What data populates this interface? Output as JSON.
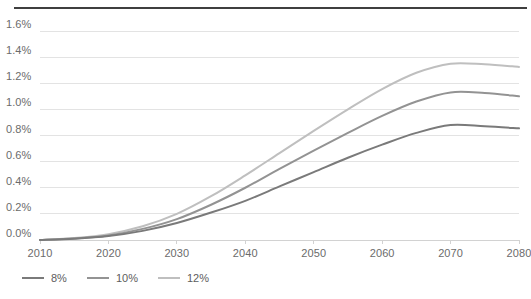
{
  "chart_data": {
    "type": "line",
    "title": "",
    "subtitle": "",
    "xlabel": "",
    "ylabel": "",
    "grid": true,
    "legend_position": "bottom-left",
    "xlim": [
      2010,
      2080
    ],
    "ylim": [
      0.0,
      1.6
    ],
    "x_tick_labels": [
      "2010",
      "2020",
      "2030",
      "2040",
      "2050",
      "2060",
      "2070",
      "2080"
    ],
    "x_ticks": [
      2010,
      2020,
      2030,
      2040,
      2050,
      2060,
      2070,
      2080
    ],
    "y_tick_labels": [
      "0.0%",
      "0.2%",
      "0.4%",
      "0.6%",
      "0.8%",
      "1.0%",
      "1.2%",
      "1.4%",
      "1.6%"
    ],
    "y_ticks": [
      0.0,
      0.2,
      0.4,
      0.6,
      0.8,
      1.0,
      1.2,
      1.4,
      1.6
    ],
    "x": [
      2010,
      2015,
      2020,
      2025,
      2030,
      2035,
      2040,
      2045,
      2050,
      2055,
      2060,
      2065,
      2070,
      2075,
      2080
    ],
    "series": [
      {
        "name": "8%",
        "color": "#7a7a7a",
        "values": [
          0.0,
          0.01,
          0.03,
          0.07,
          0.13,
          0.21,
          0.3,
          0.41,
          0.52,
          0.63,
          0.73,
          0.82,
          0.88,
          0.87,
          0.855
        ]
      },
      {
        "name": "10%",
        "color": "#939393",
        "values": [
          0.0,
          0.012,
          0.035,
          0.085,
          0.16,
          0.27,
          0.4,
          0.545,
          0.685,
          0.82,
          0.95,
          1.06,
          1.13,
          1.125,
          1.1
        ]
      },
      {
        "name": "12%",
        "color": "#bfbfbf",
        "values": [
          0.0,
          0.015,
          0.045,
          0.105,
          0.2,
          0.335,
          0.495,
          0.665,
          0.835,
          1.0,
          1.155,
          1.28,
          1.35,
          1.345,
          1.325
        ]
      }
    ]
  },
  "legend": {
    "items": [
      {
        "label": "8%",
        "color": "#7a7a7a"
      },
      {
        "label": "10%",
        "color": "#939393"
      },
      {
        "label": "12%",
        "color": "#bfbfbf"
      }
    ]
  },
  "style": {
    "rule_color": "#3f3f3f",
    "gridline_color": "#e3e3e3",
    "axis_color": "#d2d2d2",
    "tick_text_color": "#6b6b6b"
  }
}
